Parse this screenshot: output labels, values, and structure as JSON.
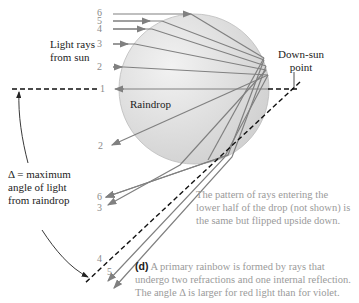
{
  "labels": {
    "light_rays": "Light rays",
    "from_sun": "from sun",
    "down_sun_1": "Down-sun",
    "down_sun_2": "point",
    "raindrop": "Raindrop",
    "delta_1": "Δ = maximum",
    "delta_2": "angle of light",
    "delta_3": "from raindrop"
  },
  "incoming_ray_numbers": [
    "6",
    "5",
    "4",
    "3",
    "2",
    "1"
  ],
  "outgoing_ray_numbers": [
    "2",
    "6",
    "3",
    "4",
    "5"
  ],
  "note": {
    "line1": "The pattern of rays entering the",
    "line2": "lower half of the drop (not shown) is",
    "line3": "the same but flipped upside down."
  },
  "caption": {
    "tag": "(d)",
    "line1": " A primary rainbow is formed by rays that",
    "line2": "undergo two refractions and one internal reflection.",
    "line3": "The angle Δ is larger for red light than for violet."
  },
  "colors": {
    "drop": "#d9d9d9",
    "ray": "#808080",
    "dash": "#111111"
  }
}
